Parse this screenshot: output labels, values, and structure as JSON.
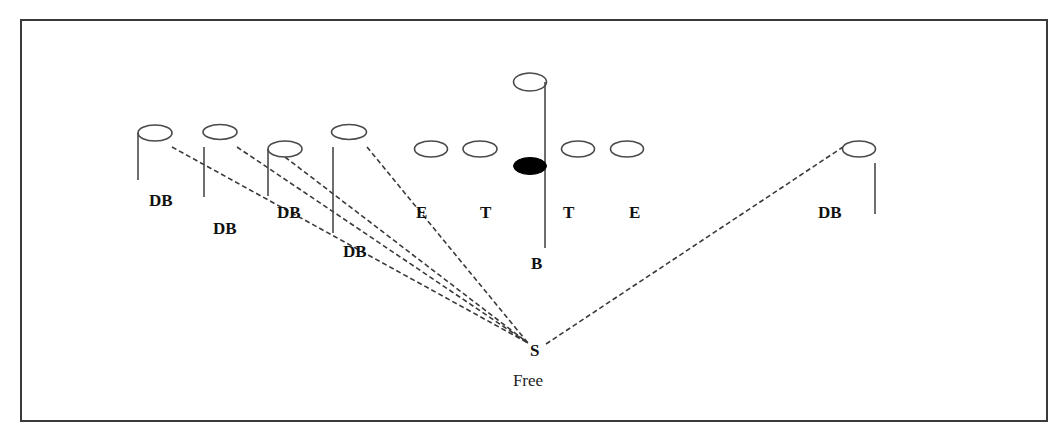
{
  "diagram": {
    "frame": {
      "x": 21,
      "y": 20,
      "width": 1026,
      "height": 401
    },
    "colors": {
      "line": "#3a3a3a",
      "ball": "#000000",
      "background": "#ffffff"
    },
    "players": [
      {
        "id": "db1",
        "role": "defensive-back",
        "cx": 155,
        "cy": 133,
        "rx": 17,
        "ry": 8,
        "stem": {
          "x": 138,
          "y1": 133,
          "y2": 180
        },
        "label": "DB",
        "lx": 149,
        "ly": 206
      },
      {
        "id": "db2",
        "role": "defensive-back",
        "cx": 220,
        "cy": 132,
        "rx": 17,
        "ry": 7.5,
        "stem": {
          "x": 204,
          "y1": 147,
          "y2": 197
        },
        "label": "DB",
        "lx": 213,
        "ly": 234
      },
      {
        "id": "db3",
        "role": "defensive-back",
        "cx": 285,
        "cy": 149,
        "rx": 17,
        "ry": 8,
        "stem": {
          "x": 268,
          "y1": 149,
          "y2": 196
        },
        "label": "DB",
        "lx": 277,
        "ly": 218
      },
      {
        "id": "db4",
        "role": "defensive-back",
        "cx": 349,
        "cy": 132,
        "rx": 17.5,
        "ry": 7.5,
        "stem": {
          "x": 333,
          "y1": 147,
          "y2": 233
        },
        "label": "DB",
        "lx": 343,
        "ly": 257
      },
      {
        "id": "end-left",
        "role": "end",
        "cx": 431,
        "cy": 149,
        "rx": 16.5,
        "ry": 8,
        "stem": null,
        "label": "E",
        "lx": 416,
        "ly": 218
      },
      {
        "id": "tackle-left",
        "role": "tackle",
        "cx": 480,
        "cy": 149,
        "rx": 17,
        "ry": 8,
        "stem": null,
        "label": "T",
        "lx": 480,
        "ly": 218
      },
      {
        "id": "back",
        "role": "back",
        "cx": 530,
        "cy": 82,
        "rx": 16.5,
        "ry": 9,
        "stem": {
          "x": 545,
          "y1": 82,
          "y2": 248
        },
        "label": "B",
        "lx": 531,
        "ly": 269
      },
      {
        "id": "tackle-right",
        "role": "tackle",
        "cx": 578,
        "cy": 149,
        "rx": 16.5,
        "ry": 8,
        "stem": null,
        "label": "T",
        "lx": 563,
        "ly": 218
      },
      {
        "id": "end-right",
        "role": "end",
        "cx": 627,
        "cy": 149,
        "rx": 16.5,
        "ry": 8,
        "stem": null,
        "label": "E",
        "lx": 629,
        "ly": 218
      },
      {
        "id": "db-right",
        "role": "defensive-back",
        "cx": 859,
        "cy": 149,
        "rx": 16.5,
        "ry": 8,
        "stem": {
          "x": 875,
          "y1": 163,
          "y2": 214
        },
        "label": "DB",
        "lx": 818,
        "ly": 218
      }
    ],
    "ball": {
      "cx": 530,
      "cy": 166,
      "rx": 16.5,
      "ry": 8.5
    },
    "safety": {
      "label": "S",
      "caption": "Free",
      "lx": 530,
      "ly": 356,
      "cx": 528,
      "cy": 386
    },
    "routes": [
      {
        "from": "db1",
        "x1": 172,
        "y1": 147,
        "x2": 528,
        "y2": 343
      },
      {
        "from": "db2",
        "x1": 237,
        "y1": 147,
        "x2": 528,
        "y2": 343
      },
      {
        "from": "db3",
        "x1": 285,
        "y1": 157,
        "x2": 528,
        "y2": 343
      },
      {
        "from": "db4",
        "x1": 367,
        "y1": 147,
        "x2": 528,
        "y2": 343
      },
      {
        "from": "db-right",
        "x1": 546,
        "y1": 344,
        "x2": 843,
        "y2": 147
      }
    ]
  }
}
